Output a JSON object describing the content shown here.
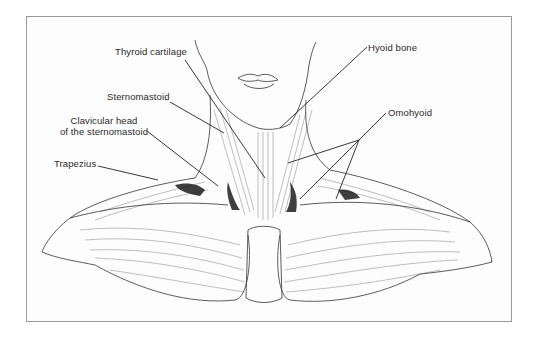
{
  "figure": {
    "type": "anatomical-illustration",
    "colors": {
      "ink": "#2a2a2a",
      "frame": "#9a9a9a",
      "background": "#ffffff"
    }
  },
  "labels": {
    "thyroid_cartilage": "Thyroid cartilage",
    "hyoid_bone": "Hyoid bone",
    "sternomastoid": "Sternomastoid",
    "clavicular_head_line1": "Clavicular head",
    "clavicular_head_line2": "of the sternomastoid",
    "trapezius": "Trapezius",
    "omohyoid": "Omohyoid"
  }
}
